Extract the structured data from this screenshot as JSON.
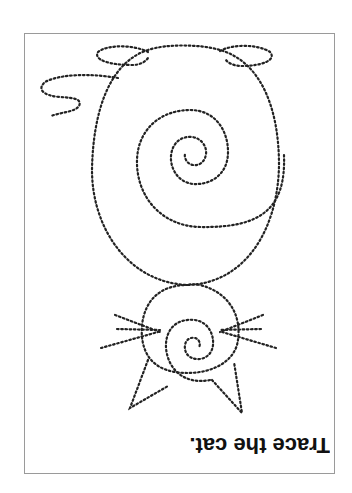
{
  "worksheet": {
    "instruction": "Trace the cat.",
    "orientation": "rotated 180°",
    "ink_color": "#222222",
    "frame_color": "#9a9a9a"
  },
  "figure": {
    "subject": "cat",
    "parts": [
      "head",
      "ears",
      "whiskers",
      "head-spiral",
      "body",
      "body-spiral",
      "tail",
      "feet"
    ]
  }
}
